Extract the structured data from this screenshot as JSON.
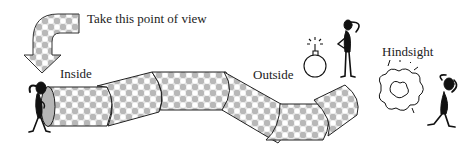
{
  "labels": {
    "instruction": "Take this point of view",
    "inside": "Inside",
    "outside": "Outside",
    "hindsight": "Hindsight"
  },
  "elements": {
    "arrow": "curved-down-arrow-icon",
    "tube": "segmented-tube",
    "figure_inside": "thinking-figure-icon",
    "bomb": "bomb-icon",
    "figure_outside": "thinking-figure-icon",
    "explosion": "explosion-cloud-icon",
    "figure_hindsight": "head-in-hands-figure-icon"
  },
  "colors": {
    "ink": "#1a1a1a",
    "pattern_light": "#f4f4f4",
    "pattern_dark": "#9a9a9a",
    "background": "#ffffff"
  }
}
